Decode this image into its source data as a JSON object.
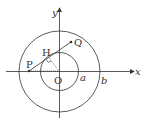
{
  "diagram": {
    "type": "geometry",
    "axes": {
      "x_label": "x",
      "y_label": "y"
    },
    "points": {
      "origin": "O",
      "P": "P",
      "Q": "Q",
      "H": "H"
    },
    "radii_labels": {
      "inner": "a",
      "outer": "b"
    },
    "colors": {
      "stroke": "#333333",
      "background": "#ffffff"
    }
  }
}
